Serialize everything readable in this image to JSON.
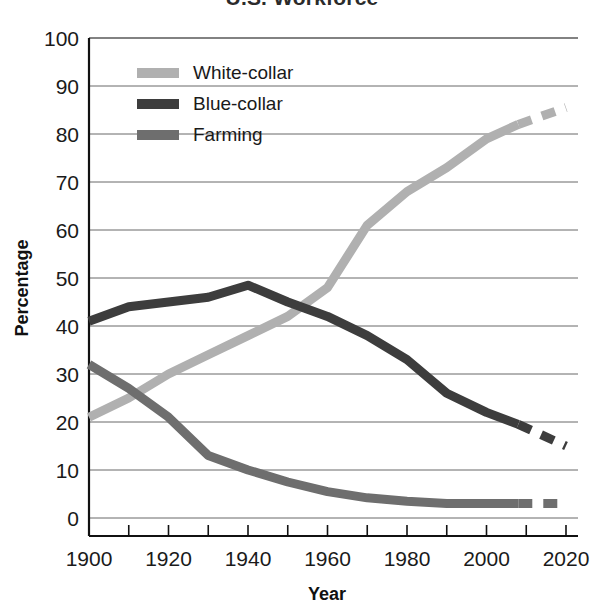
{
  "chart_data": {
    "type": "line",
    "title": "U.S. Workforce",
    "xlabel": "Year",
    "ylabel": "Percentage",
    "xlim": [
      1900,
      2020
    ],
    "ylim": [
      0,
      100
    ],
    "grid": true,
    "legend_position": "top-left",
    "x_ticks": [
      1900,
      1920,
      1940,
      1960,
      1980,
      2000,
      2020
    ],
    "x_minor_ticks": [
      1910,
      1930,
      1950,
      1970,
      1990,
      2010
    ],
    "y_ticks": [
      0,
      10,
      20,
      30,
      40,
      50,
      60,
      70,
      80,
      90,
      100
    ],
    "projection_start": 2008,
    "series": [
      {
        "name": "White-collar",
        "color": "#b0b0b0",
        "x": [
          1900,
          1910,
          1920,
          1930,
          1940,
          1950,
          1960,
          1970,
          1980,
          1990,
          2000,
          2008
        ],
        "values": [
          21,
          25,
          30,
          34,
          38,
          42,
          48,
          61,
          68,
          73,
          79,
          82
        ],
        "projected_x": [
          2008,
          2020
        ],
        "projected_values": [
          82,
          85.5
        ]
      },
      {
        "name": "Blue-collar",
        "color": "#3d3d3d",
        "x": [
          1900,
          1910,
          1920,
          1930,
          1940,
          1950,
          1960,
          1970,
          1980,
          1990,
          2000,
          2008
        ],
        "values": [
          41,
          44,
          45,
          46,
          48.5,
          45,
          42,
          38,
          33,
          26,
          22,
          19.5
        ],
        "projected_x": [
          2008,
          2020
        ],
        "projected_values": [
          19.5,
          15
        ]
      },
      {
        "name": "Farming",
        "color": "#6e6e6e",
        "x": [
          1900,
          1910,
          1920,
          1930,
          1940,
          1950,
          1960,
          1970,
          1980,
          1990,
          2000,
          2008
        ],
        "values": [
          32,
          27,
          21,
          13,
          10,
          7.5,
          5.5,
          4.2,
          3.5,
          3,
          3,
          3
        ],
        "projected_x": [
          2008,
          2020
        ],
        "projected_values": [
          3,
          3
        ]
      }
    ]
  },
  "legend": {
    "items": [
      {
        "label": "White-collar"
      },
      {
        "label": "Blue-collar"
      },
      {
        "label": "Farming"
      }
    ]
  },
  "axes": {
    "y_tick_labels": [
      "100",
      "90",
      "80",
      "70",
      "60",
      "50",
      "40",
      "30",
      "20",
      "10",
      "0"
    ],
    "x_tick_labels": [
      "1900",
      "1920",
      "1940",
      "1960",
      "1980",
      "2000",
      "2020"
    ],
    "y_axis_title": "Percentage",
    "x_axis_title": "Year"
  }
}
